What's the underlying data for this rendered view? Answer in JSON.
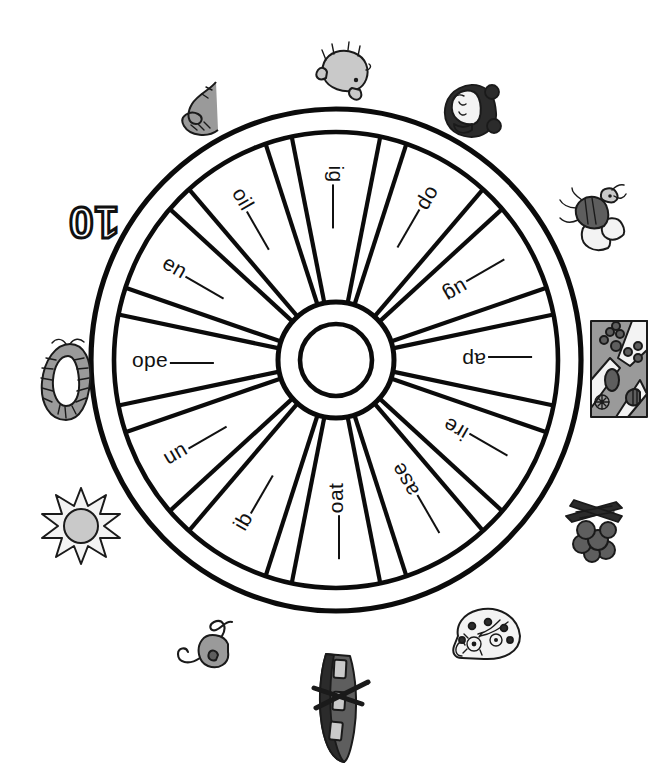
{
  "worksheet": {
    "type": "word-family-wheel",
    "orientation_note": "wheel content printed upside down",
    "spoke_count": 12,
    "clue_count": 12
  },
  "wheel": {
    "hub_label": "",
    "spokes": [
      {
        "index": 0,
        "angle_deg": 90,
        "rime": "ig",
        "blank_side": "after",
        "text": "ig ___"
      },
      {
        "index": 1,
        "angle_deg": 60,
        "rime": "op",
        "blank_side": "after",
        "text": "op ___"
      },
      {
        "index": 2,
        "angle_deg": 30,
        "rime": "ug",
        "blank_side": "before",
        "text": "___ ug"
      },
      {
        "index": 3,
        "angle_deg": 0,
        "rime": "ap",
        "blank_side": "before",
        "text": "___ ap"
      },
      {
        "index": 4,
        "angle_deg": 330,
        "rime": "ire",
        "blank_side": "before",
        "text": "___ ire"
      },
      {
        "index": 5,
        "angle_deg": 300,
        "rime": "ase",
        "blank_side": "before",
        "text": "___ ase"
      },
      {
        "index": 6,
        "angle_deg": 270,
        "rime": "oat",
        "blank_side": "before",
        "text": "___ oat"
      },
      {
        "index": 7,
        "angle_deg": 240,
        "rime": "ib",
        "blank_side": "after",
        "text": "ib ___"
      },
      {
        "index": 8,
        "angle_deg": 210,
        "rime": "un",
        "blank_side": "after",
        "text": "un ___"
      },
      {
        "index": 9,
        "angle_deg": 180,
        "rime": "ope",
        "blank_side": "after",
        "text": "ope ___"
      },
      {
        "index": 10,
        "angle_deg": 150,
        "rime": "en",
        "blank_side": "after",
        "text": "en ___"
      },
      {
        "index": 11,
        "angle_deg": 120,
        "rime": "oil",
        "blank_side": "after",
        "text": "oil ___"
      }
    ]
  },
  "clues": [
    {
      "index": 0,
      "name": "pig",
      "icon": "pig-icon",
      "position": "top"
    },
    {
      "index": 1,
      "name": "mop",
      "icon": "girl-head-icon",
      "position": "top-right"
    },
    {
      "index": 2,
      "name": "bug",
      "icon": "bug-icon",
      "position": "right-upper"
    },
    {
      "index": 3,
      "name": "map",
      "icon": "map-icon",
      "position": "right"
    },
    {
      "index": 4,
      "name": "fire",
      "icon": "campfire-icon",
      "position": "right-lower"
    },
    {
      "index": 5,
      "name": "vase",
      "icon": "vase-icon",
      "position": "bottom-right"
    },
    {
      "index": 6,
      "name": "boat",
      "icon": "boat-icon",
      "position": "bottom"
    },
    {
      "index": 7,
      "name": "bib",
      "icon": "tadpole-icon",
      "position": "bottom-left"
    },
    {
      "index": 8,
      "name": "sun",
      "icon": "sun-icon",
      "position": "left-lower"
    },
    {
      "index": 9,
      "name": "rope",
      "icon": "rope-icon",
      "position": "left"
    },
    {
      "index": 10,
      "name": "ten",
      "icon": "number-10-icon",
      "position": "left-upper",
      "label": "10"
    },
    {
      "index": 11,
      "name": "coil",
      "icon": "snake-icon",
      "position": "top-left"
    }
  ],
  "colors": {
    "ink": "#1a1a1a",
    "paper": "#ffffff",
    "shade_light": "#c9c9c9",
    "shade_mid": "#9a9a9a",
    "shade_dark": "#5e5e5e"
  }
}
